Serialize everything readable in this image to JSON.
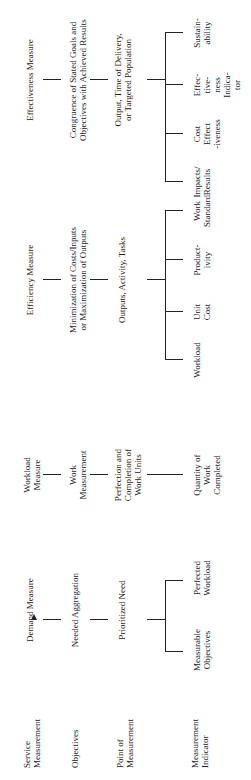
{
  "row_labels": [
    "Service\nMeasurement",
    "Objectives",
    "Point of\nMeasurement",
    "Measurement\nIndicator"
  ],
  "demand": {
    "title": "Demand Measure",
    "objective": "Needed Aggregation",
    "point": "Prioritized Need",
    "indicators": [
      "Measurable\nObjectives",
      "Perfected\nWorkload"
    ]
  },
  "workload": {
    "title": "Workload\nMeasure",
    "objective": "Work\nMeasurement",
    "point": "Perfection and\nCompletion of\nWork Units",
    "indicator": "Quantity of\nWork\nCompleted"
  },
  "efficiency": {
    "title": "Efficiency Measure",
    "objective": "Minimization of Costs/Inputs\nor Maximization of Outputs",
    "point": "Outputs, Activity, Tasks",
    "indicators": [
      "Workload",
      "Unit\nCost",
      "Product-\nivity",
      "Work\nStandard"
    ]
  },
  "effectiveness": {
    "title": "Effectiveness Measure",
    "objective": "Congruence of Stated Goals and\nObjectives with Achieved Results",
    "point": "Output, Time of Delivery,\nor Targeted Population",
    "indicators": [
      "Impacts/\nResults",
      "Cost\nEffect\n-iveness",
      "Effec-\ntive-\nness\nIndica-\ntor",
      "Sustain-\nability"
    ]
  }
}
